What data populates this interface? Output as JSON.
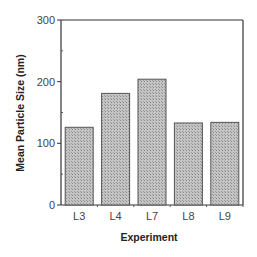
{
  "chart_data": {
    "type": "bar",
    "title": "",
    "xlabel": "Experiment",
    "ylabel": "Mean Particle Size (nm)",
    "categories": [
      "L3",
      "L4",
      "L7",
      "L8",
      "L9"
    ],
    "values": [
      126,
      181,
      204,
      133,
      134
    ],
    "ylim": [
      0,
      300
    ],
    "yticks": [
      0,
      100,
      200,
      300
    ],
    "grid": false,
    "legend": null,
    "bar_fill": "#b8b8b8",
    "bar_edge": "#555555"
  }
}
